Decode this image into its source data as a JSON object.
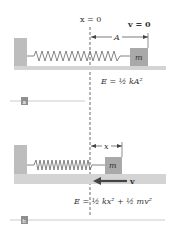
{
  "top_panel": {
    "tag": "a",
    "origin_label": "x = 0",
    "velocity_label": "v = 0",
    "amplitude_label": "A",
    "mass_label": "m",
    "energy_eq": "E = ½ kA²"
  },
  "bottom_panel": {
    "tag": "b",
    "displacement_label": "x",
    "mass_label": "m",
    "velocity_label": "v",
    "energy_eq": "E = ½ kx² + ½ mv²"
  },
  "colors": {
    "wall": "#bdbdbd",
    "floor": "#d4d4d4",
    "mass": "#a9a9a9",
    "spring": "#666666",
    "arrow": "#444444",
    "tag_bg": "#8f8f8f"
  }
}
